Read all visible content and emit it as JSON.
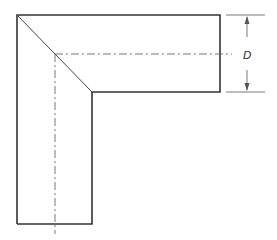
{
  "diagram": {
    "type": "mitered L-bend (elbow) drawing with centerlines",
    "dimension_label": "D",
    "colors": {
      "outline": "#333333",
      "centerline": "#666666",
      "dimension": "#555555",
      "background": "#ffffff"
    }
  }
}
